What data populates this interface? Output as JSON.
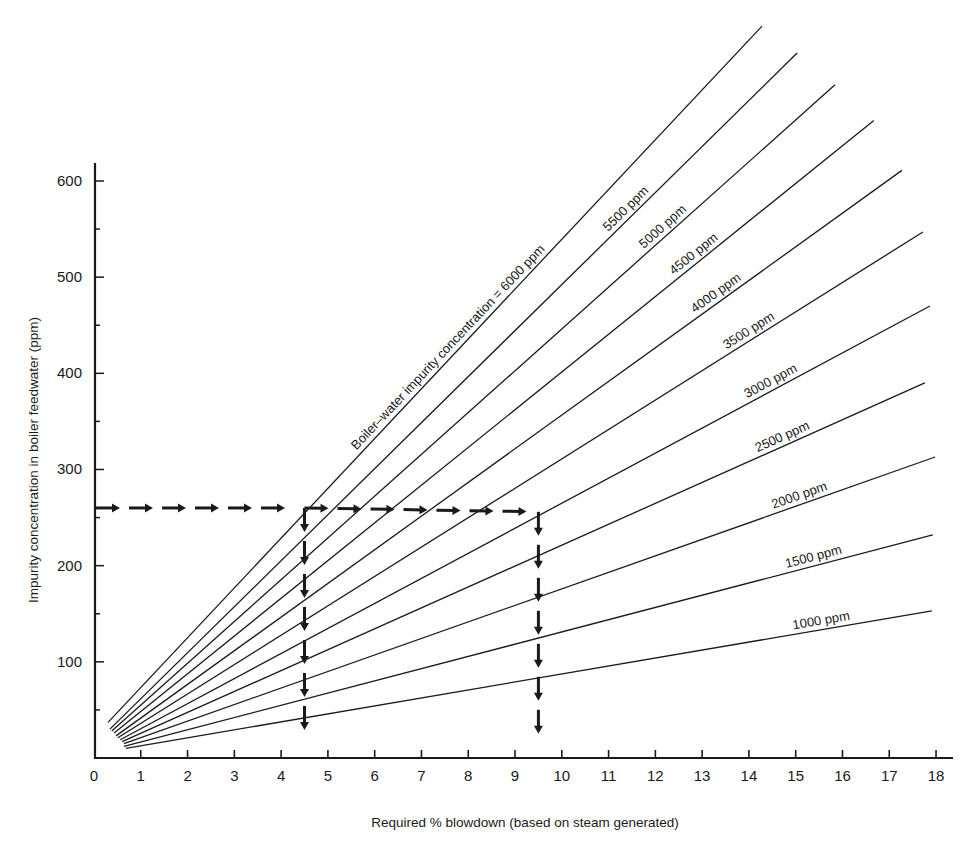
{
  "chart_data": {
    "type": "line",
    "title": "",
    "xlabel": "Required % blowdown (based on steam generated)",
    "ylabel": "Impurity concentration in boiler feedwater (ppm)",
    "xlim": [
      0,
      18
    ],
    "ylim": [
      0,
      620
    ],
    "x_ticks": [
      0,
      1,
      2,
      3,
      4,
      5,
      6,
      7,
      8,
      9,
      10,
      11,
      12,
      13,
      14,
      15,
      16,
      17,
      18
    ],
    "y_ticks": [
      100,
      200,
      300,
      400,
      500,
      600
    ],
    "y_minor_step": 50,
    "grid": false,
    "legend": "inline labels along lines",
    "series": [
      {
        "name": "6000 ppm",
        "label": "Boiler–water impurity concentration = 6000 ppm",
        "start": [
          0.3,
          37
        ],
        "end": [
          14.28,
          761
        ]
      },
      {
        "name": "5500 ppm",
        "label": "5500 ppm",
        "start": [
          0.34,
          30
        ],
        "end": [
          15.03,
          733
        ]
      },
      {
        "name": "5000 ppm",
        "label": "5000 ppm",
        "start": [
          0.38,
          28
        ],
        "end": [
          15.84,
          700
        ]
      },
      {
        "name": "4500 ppm",
        "label": "4500 ppm",
        "start": [
          0.43,
          26
        ],
        "end": [
          16.67,
          663
        ]
      },
      {
        "name": "4000 ppm",
        "label": "4000 ppm",
        "start": [
          0.47,
          23
        ],
        "end": [
          17.27,
          611
        ]
      },
      {
        "name": "3500 ppm",
        "label": "3500 ppm",
        "start": [
          0.51,
          21
        ],
        "end": [
          17.72,
          547
        ]
      },
      {
        "name": "3000 ppm",
        "label": "3000 ppm",
        "start": [
          0.56,
          19
        ],
        "end": [
          17.87,
          470
        ]
      },
      {
        "name": "2500 ppm",
        "label": "2500 ppm",
        "start": [
          0.6,
          17
        ],
        "end": [
          17.76,
          390
        ]
      },
      {
        "name": "2000 ppm",
        "label": "2000 ppm",
        "start": [
          0.64,
          15
        ],
        "end": [
          17.98,
          313
        ]
      },
      {
        "name": "1500 ppm",
        "label": "1500 ppm",
        "start": [
          0.64,
          12
        ],
        "end": [
          17.93,
          232
        ]
      },
      {
        "name": "1000 ppm",
        "label": "1000 ppm",
        "start": [
          0.68,
          10
        ],
        "end": [
          17.91,
          153
        ]
      }
    ],
    "annotations": [
      {
        "type": "dashed-arrow-path",
        "description": "Feedwater 260 ppm horizontal to 6000 ppm line, drop to 4.5% blowdown",
        "points": [
          [
            0,
            260
          ],
          [
            4.5,
            260
          ],
          [
            4.5,
            0
          ]
        ]
      },
      {
        "type": "dashed-arrow-path",
        "description": "Feedwater 260 ppm horizontal to 3000 ppm line, drop to 9.5% blowdown",
        "points": [
          [
            4.5,
            260
          ],
          [
            9.5,
            256
          ],
          [
            9.5,
            0
          ]
        ]
      }
    ],
    "formula_hint": "feedwater_ppm = boiler_ppm * B / (100 + B)"
  },
  "labels": {
    "xlabel": "Required % blowdown (based on steam generated)",
    "ylabel": "Impurity concentration in boiler feedwater (ppm)"
  },
  "colors": {
    "ink": "#1a1a1a",
    "background": "#ffffff"
  }
}
